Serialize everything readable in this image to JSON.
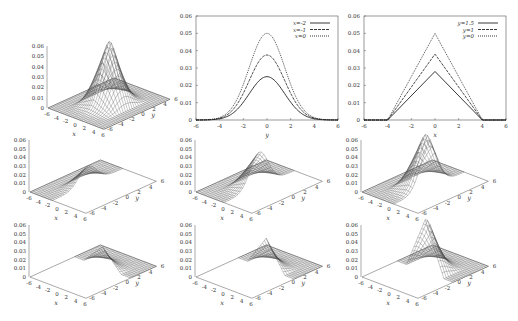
{
  "chart_data": [
    {
      "id": "surf-full",
      "type": "surface",
      "title": "",
      "xlabel": "x",
      "ylabel": "y",
      "zlabel": "",
      "xlim": [
        -6,
        6
      ],
      "ylim": [
        -6,
        6
      ],
      "zlim": [
        0,
        0.06
      ],
      "xticks": [
        "-6",
        "-4",
        "-2",
        "0",
        "2",
        "4",
        "6"
      ],
      "yticks": [
        "-6",
        "-4",
        "-2",
        "0",
        "2",
        "4",
        "6"
      ],
      "zticks": [
        "0",
        "0.01",
        "0.02",
        "0.03",
        "0.04",
        "0.05",
        "0.06"
      ],
      "surface": {
        "peak": 0.06,
        "x_cut": null,
        "y_cut": null,
        "shape": "pyramid-gaussian"
      }
    },
    {
      "id": "slice-x",
      "type": "line",
      "xlabel": "y",
      "ylabel": "",
      "xlim": [
        -6,
        6
      ],
      "ylim": [
        0,
        0.06
      ],
      "xticks": [
        "-6",
        "-4",
        "-2",
        "0",
        "2",
        "4",
        "6"
      ],
      "yticks": [
        "0",
        "0.01",
        "0.02",
        "0.03",
        "0.04",
        "0.05",
        "0.06"
      ],
      "legend_position": "top-right",
      "series": [
        {
          "name": "x=-2",
          "style": "solid",
          "peak": 0.025,
          "x": [
            -6,
            -5,
            -4,
            -3,
            -2,
            -1,
            0,
            1,
            2,
            3,
            4,
            5,
            6
          ],
          "y": [
            0.0,
            0.0002,
            0.0011,
            0.0041,
            0.0101,
            0.0192,
            0.025,
            0.0192,
            0.0101,
            0.0041,
            0.0011,
            0.0002,
            0.0
          ]
        },
        {
          "name": "x=-1",
          "style": "dashed",
          "peak": 0.0375,
          "x": [
            -6,
            -5,
            -4,
            -3,
            -2,
            -1,
            0,
            1,
            2,
            3,
            4,
            5,
            6
          ],
          "y": [
            0.0,
            0.0003,
            0.0017,
            0.0062,
            0.0152,
            0.0288,
            0.0375,
            0.0288,
            0.0152,
            0.0062,
            0.0017,
            0.0003,
            0.0
          ]
        },
        {
          "name": "x=0",
          "style": "dotted",
          "peak": 0.05,
          "x": [
            -6,
            -5,
            -4,
            -3,
            -2,
            -1,
            0,
            1,
            2,
            3,
            4,
            5,
            6
          ],
          "y": [
            0.0,
            0.0004,
            0.0023,
            0.0082,
            0.0203,
            0.0384,
            0.05,
            0.0384,
            0.0203,
            0.0082,
            0.0023,
            0.0004,
            0.0
          ]
        }
      ]
    },
    {
      "id": "slice-y",
      "type": "line",
      "xlabel": "x",
      "ylabel": "",
      "xlim": [
        -6,
        6
      ],
      "ylim": [
        0,
        0.06
      ],
      "xticks": [
        "-6",
        "-4",
        "-2",
        "0",
        "2",
        "4",
        "6"
      ],
      "yticks": [
        "0",
        "0.01",
        "0.02",
        "0.03",
        "0.04",
        "0.05",
        "0.06"
      ],
      "legend_position": "top-right",
      "series": [
        {
          "name": "y=1.5",
          "style": "solid",
          "x": [
            -6,
            -4,
            0,
            4,
            6
          ],
          "y": [
            0,
            0,
            0.028,
            0,
            0
          ]
        },
        {
          "name": "y=1",
          "style": "dashed",
          "x": [
            -6,
            -4,
            0,
            4,
            6
          ],
          "y": [
            0,
            0,
            0.038,
            0,
            0
          ]
        },
        {
          "name": "y=0",
          "style": "dotted",
          "x": [
            -6,
            -4,
            0,
            4,
            6
          ],
          "y": [
            0,
            0,
            0.05,
            0,
            0
          ]
        }
      ]
    },
    {
      "id": "surf-r2c1",
      "type": "surface",
      "xlabel": "x",
      "ylabel": "y",
      "xlim": [
        -6,
        6
      ],
      "ylim": [
        -6,
        6
      ],
      "zlim": [
        0,
        0.06
      ],
      "xticks": [
        "-6",
        "-4",
        "-2",
        "0",
        "2",
        "4",
        "6"
      ],
      "yticks": [
        "-6",
        "-4",
        "-2",
        "0",
        "2",
        "4",
        "6"
      ],
      "zticks": [
        "0",
        "0.01",
        "0.02",
        "0.03",
        "0.04",
        "0.05",
        "0.06"
      ],
      "surface": {
        "peak": 0.03,
        "region": "x<=-1"
      }
    },
    {
      "id": "surf-r2c2",
      "type": "surface",
      "xlabel": "x",
      "ylabel": "y",
      "xlim": [
        -6,
        6
      ],
      "ylim": [
        -6,
        6
      ],
      "zlim": [
        0,
        0.06
      ],
      "xticks": [
        "-6",
        "-4",
        "-2",
        "0",
        "2",
        "4",
        "6"
      ],
      "yticks": [
        "-6",
        "-4",
        "-2",
        "0",
        "2",
        "4",
        "6"
      ],
      "zticks": [
        "0",
        "0.01",
        "0.02",
        "0.03",
        "0.04",
        "0.05",
        "0.06"
      ],
      "surface": {
        "peak": 0.04,
        "region": "x<=0"
      }
    },
    {
      "id": "surf-r2c3",
      "type": "surface",
      "xlabel": "x",
      "ylabel": "y",
      "xlim": [
        -6,
        6
      ],
      "ylim": [
        -6,
        6
      ],
      "zlim": [
        0,
        0.06
      ],
      "xticks": [
        "-6",
        "-4",
        "-2",
        "0",
        "2",
        "4",
        "6"
      ],
      "yticks": [
        "-6",
        "-4",
        "-2",
        "0",
        "2",
        "4",
        "6"
      ],
      "zticks": [
        "0",
        "0.01",
        "0.02",
        "0.03",
        "0.04",
        "0.05",
        "0.06"
      ],
      "surface": {
        "peak": 0.06,
        "region": "x<=1"
      }
    },
    {
      "id": "surf-r3c1",
      "type": "surface",
      "xlabel": "x",
      "ylabel": "y",
      "xlim": [
        -6,
        6
      ],
      "ylim": [
        -6,
        6
      ],
      "zlim": [
        0,
        0.06
      ],
      "xticks": [
        "-6",
        "-4",
        "-2",
        "0",
        "2",
        "4",
        "6"
      ],
      "yticks": [
        "-6",
        "-4",
        "-2",
        "0",
        "2",
        "4",
        "6"
      ],
      "zticks": [
        "0",
        "0.01",
        "0.02",
        "0.03",
        "0.04",
        "0.05",
        "0.06"
      ],
      "surface": {
        "peak": 0.042,
        "region": "y>=1.5"
      }
    },
    {
      "id": "surf-r3c2",
      "type": "surface",
      "xlabel": "x",
      "ylabel": "y",
      "xlim": [
        -6,
        6
      ],
      "ylim": [
        -6,
        6
      ],
      "zlim": [
        0,
        0.06
      ],
      "xticks": [
        "-6",
        "-4",
        "-2",
        "0",
        "2",
        "4",
        "6"
      ],
      "yticks": [
        "-6",
        "-4",
        "-2",
        "0",
        "2",
        "4",
        "6"
      ],
      "zticks": [
        "0",
        "0.01",
        "0.02",
        "0.03",
        "0.04",
        "0.05",
        "0.06"
      ],
      "surface": {
        "peak": 0.048,
        "region": "y>=1"
      }
    },
    {
      "id": "surf-r3c3",
      "type": "surface",
      "xlabel": "x",
      "ylabel": "y",
      "xlim": [
        -6,
        6
      ],
      "ylim": [
        -6,
        6
      ],
      "zlim": [
        0,
        0.06
      ],
      "xticks": [
        "-6",
        "-4",
        "-2",
        "0",
        "2",
        "4",
        "6"
      ],
      "yticks": [
        "-6",
        "-4",
        "-2",
        "0",
        "2",
        "4",
        "6"
      ],
      "zticks": [
        "0",
        "0.01",
        "0.02",
        "0.03",
        "0.04",
        "0.05",
        "0.06"
      ],
      "surface": {
        "peak": 0.06,
        "region": "y>=0"
      }
    }
  ]
}
